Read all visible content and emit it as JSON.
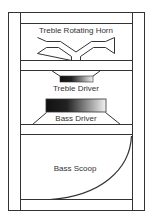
{
  "diagram": {
    "labels": {
      "horn": "Treble Rotating Horn",
      "treble_driver": "Treble Driver",
      "bass_driver": "Bass Driver",
      "scoop": "Bass Scoop"
    },
    "colors": {
      "line": "#333333",
      "background": "#ffffff",
      "gradient_dark": "#111111",
      "gradient_light": "#f2f2f2"
    }
  }
}
